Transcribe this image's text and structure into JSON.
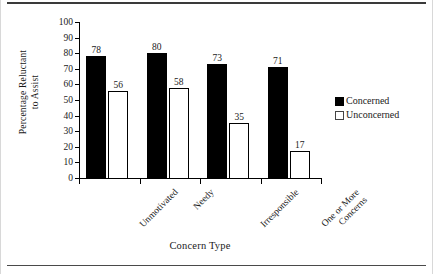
{
  "chart_data": {
    "type": "bar",
    "title": "",
    "xlabel": "Concern Type",
    "ylabel": "Percentage Reluctant to Assist",
    "ylabel_lines": [
      "Percentage Reluctant",
      "to Assist"
    ],
    "categories": [
      "Unmotivated",
      "Needy",
      "Irresponsible",
      "One or More Concerns"
    ],
    "category_lines": [
      [
        "Unmotivated"
      ],
      [
        "Needy"
      ],
      [
        "Irresponsible"
      ],
      [
        "One or More",
        "Concerns"
      ]
    ],
    "series": [
      {
        "name": "Concerned",
        "values": [
          78,
          80,
          73,
          71
        ],
        "color": "#000000",
        "fill": "solid"
      },
      {
        "name": "Unconcerned",
        "values": [
          56,
          58,
          35,
          17
        ],
        "color": "#ffffff",
        "fill": "open"
      }
    ],
    "ylim": [
      0,
      100
    ],
    "yticks": [
      0,
      10,
      20,
      30,
      40,
      50,
      60,
      70,
      80,
      90,
      100
    ],
    "ytick_labels": [
      "0",
      "10",
      "20",
      "30",
      "40",
      "50",
      "60",
      "70",
      "80",
      "90",
      "100"
    ],
    "grid": false,
    "legend_position": "right",
    "data_labels": [
      78,
      56,
      80,
      58,
      73,
      35,
      71,
      17
    ]
  },
  "legend": {
    "items": [
      {
        "label": "Concerned",
        "swatch": "filled-square-icon"
      },
      {
        "label": "Unconcerned",
        "swatch": "open-square-icon"
      }
    ]
  },
  "axes": {
    "x_title": "Concern Type",
    "y_title_line1": "Percentage Reluctant",
    "y_title_line2": "to Assist"
  }
}
